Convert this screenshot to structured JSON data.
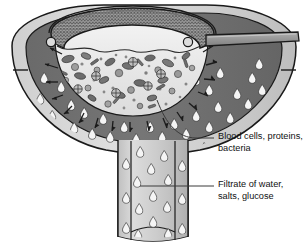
{
  "figure": {
    "background_color": "#ffffff"
  },
  "labels": [
    {
      "id": "blood",
      "name": "blood-cells-label",
      "line1": "Blood cells, proteins,",
      "line2": "bacteria",
      "leader_from_x": 203,
      "leader_from_y": 138,
      "leader_to_x": 155,
      "leader_to_y": 96
    },
    {
      "id": "filtrate",
      "name": "filtrate-label",
      "line1": "Filtrate of water,",
      "line2": "salts, glucose",
      "leader_from_x": 214,
      "leader_from_y": 186,
      "leader_to_x": 140,
      "leader_to_y": 186
    }
  ],
  "structures": {
    "outer_shell": "outer-capsule-shell",
    "filtrate_chamber": "filtrate-chamber",
    "inner_bowl": "inner-blood-bowl",
    "mesh_rim": "filter-mesh-rim",
    "handle": "afferent-vessel-handle",
    "stem": "collecting-tubule-stem",
    "left_knob": "left-rim-knob",
    "right_knob": "right-rim-knob",
    "left_tick": "left-edge-tick",
    "right_tick": "right-edge-tick"
  },
  "colors": {
    "outline": "#1a1a1a",
    "outer_shell_light": "#d6d6d6",
    "outer_shell_mid": "#c2c2c2",
    "filtrate_chamber_dark": "#6e6e6e",
    "inner_bowl_fill": "#e9e9e9",
    "inner_bowl_top_fill": "#f2f2f2",
    "mesh_band": "#8c8c8c",
    "handle_fill": "#9a9a9a",
    "stem_light": "#d9d9d9",
    "stem_mid": "#b8b8b8",
    "droplet_fill": "#f4f4f4",
    "cell_dark": "#6f6f6f",
    "cell_mid": "#8f8f8f",
    "cell_light": "#b4b4b4",
    "label_text": "#111111"
  },
  "contents": {
    "inner_particles": "blood cells, proteins and bacteria shown as gray ovals, rods and crossed circles",
    "chamber_droplets": "white teardrop filtrate droplets",
    "arrows": "filtration arrows pointing outward through the membrane"
  }
}
